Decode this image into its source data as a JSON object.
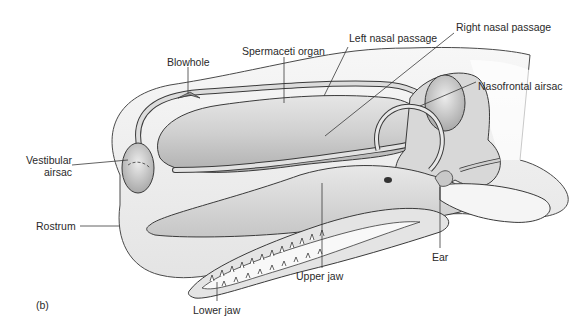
{
  "figure": {
    "panel_label": "(b)",
    "labels": {
      "blowhole": "Blowhole",
      "spermaceti_organ": "Spermaceti organ",
      "left_nasal_passage": "Left nasal passage",
      "right_nasal_passage": "Right nasal passage",
      "nasofrontal_airsac": "Nasofrontal airsac",
      "vestibular_airsac_line1": "Vestibular",
      "vestibular_airsac_line2": "airsac",
      "rostrum": "Rostrum",
      "upper_jaw": "Upper jaw",
      "lower_jaw": "Lower jaw",
      "ear": "Ear"
    },
    "colors": {
      "line": "#3a3a3a",
      "skin": "#f1f1f1",
      "organ": "#d4d4d4",
      "shade": "#b5b5b5",
      "text": "#2a2a2a"
    }
  }
}
